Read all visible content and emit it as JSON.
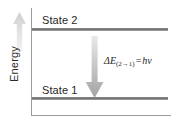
{
  "figure": {
    "axes": {
      "y_label": "Energy",
      "y_direction_icon": "up-arrow-icon",
      "x_label": ""
    },
    "levels": [
      {
        "id": "state2",
        "label": "State 2",
        "position": "upper"
      },
      {
        "id": "state1",
        "label": "State 1",
        "position": "lower"
      }
    ],
    "transition": {
      "icon": "down-arrow-icon",
      "direction": "downward",
      "from": "State 2",
      "to": "State 1"
    },
    "equation": {
      "delta": "Δ",
      "energy_symbol": "E",
      "subscript_open": "(",
      "subscript_from": "2",
      "subscript_arrow": "→",
      "subscript_to": "1",
      "subscript_close": ")",
      "equals": "=",
      "planck": "h",
      "nu": "ν",
      "full_text": "ΔE(2→1) = hν"
    },
    "colors": {
      "level_line": "#6f6f6f",
      "axis": "#9a9a9a",
      "text": "#1f1f1f",
      "arrow_light": "#e2e2e2",
      "arrow_dark": "#9b9b9b",
      "background": "#ffffff"
    }
  }
}
